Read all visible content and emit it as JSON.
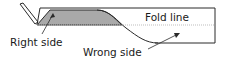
{
  "diagram": {
    "labels": {
      "fold_line": "Fold line",
      "right_side": "Right side",
      "wrong_side": "Wrong side"
    },
    "colors": {
      "stroke": "#2a2a2a",
      "shade": "#a9a9a9",
      "fold_line": "#bdbdbd",
      "text": "#1a1a1a"
    }
  }
}
